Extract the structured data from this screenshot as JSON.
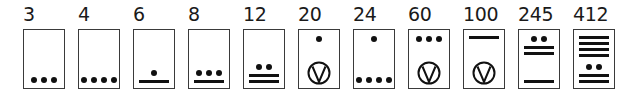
{
  "colors": {
    "ink": "#111111",
    "border": "#3a3a3a",
    "background": "#ffffff"
  },
  "cards": [
    {
      "label": "3",
      "x": 23,
      "upper": null,
      "lower": {
        "dots": 3,
        "bars": 0,
        "shell": false
      }
    },
    {
      "label": "4",
      "x": 78,
      "upper": null,
      "lower": {
        "dots": 4,
        "bars": 0,
        "shell": false
      }
    },
    {
      "label": "6",
      "x": 133,
      "upper": null,
      "lower": {
        "dots": 1,
        "bars": 1,
        "shell": false
      }
    },
    {
      "label": "8",
      "x": 188,
      "upper": null,
      "lower": {
        "dots": 3,
        "bars": 1,
        "shell": false
      }
    },
    {
      "label": "12",
      "x": 243,
      "upper": null,
      "lower": {
        "dots": 2,
        "bars": 2,
        "shell": false
      }
    },
    {
      "label": "20",
      "x": 298,
      "upper": {
        "dots": 1,
        "bars": 0
      },
      "lower": {
        "dots": 0,
        "bars": 0,
        "shell": true
      }
    },
    {
      "label": "24",
      "x": 353,
      "upper": {
        "dots": 1,
        "bars": 0
      },
      "lower": {
        "dots": 4,
        "bars": 0,
        "shell": false
      }
    },
    {
      "label": "60",
      "x": 408,
      "upper": {
        "dots": 3,
        "bars": 0
      },
      "lower": {
        "dots": 0,
        "bars": 0,
        "shell": true
      }
    },
    {
      "label": "100",
      "x": 463,
      "upper": {
        "dots": 0,
        "bars": 1
      },
      "lower": {
        "dots": 0,
        "bars": 0,
        "shell": true
      }
    },
    {
      "label": "245",
      "x": 518,
      "upper": {
        "dots": 2,
        "bars": 2
      },
      "lower": {
        "dots": 0,
        "bars": 1,
        "shell": false
      }
    },
    {
      "label": "412",
      "x": 573,
      "upper": {
        "dots": 0,
        "bars": 4
      },
      "lower": {
        "dots": 2,
        "bars": 2,
        "shell": false
      }
    }
  ]
}
